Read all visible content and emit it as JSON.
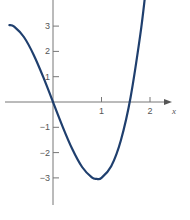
{
  "chart_data": {
    "type": "line",
    "title": "",
    "xlabel": "x",
    "ylabel": "",
    "xlim": [
      -1.1,
      2.7
    ],
    "ylim": [
      -4.7,
      4.0
    ],
    "grid": false,
    "legend": null,
    "x_ticks": [
      {
        "value": 1,
        "label": "1"
      },
      {
        "value": 2,
        "label": "2"
      }
    ],
    "y_ticks": [
      {
        "value": 3,
        "label": "3"
      },
      {
        "value": 2,
        "label": "2"
      },
      {
        "value": 1,
        "label": "1"
      },
      {
        "value": -1,
        "label": "−1"
      },
      {
        "value": -2,
        "label": "−2"
      },
      {
        "value": -3,
        "label": "−3"
      }
    ],
    "series": [
      {
        "name": "f(x)",
        "color": "#1f3f6e",
        "x": [
          -0.9,
          -0.8,
          -0.6,
          -0.4,
          -0.2,
          0.0,
          0.2,
          0.4,
          0.6,
          0.8,
          0.9,
          1.0,
          1.2,
          1.4,
          1.6,
          1.8,
          1.9
        ],
        "y": [
          3.04,
          2.98,
          2.57,
          1.87,
          0.98,
          0.0,
          -0.98,
          -1.87,
          -2.57,
          -2.98,
          -3.04,
          -3.0,
          -2.54,
          -1.51,
          0.19,
          2.66,
          4.2
        ]
      }
    ],
    "annotations": [
      {
        "text": "x",
        "position": "end of x-axis"
      }
    ]
  },
  "colors": {
    "curve": "#1f3f6e",
    "axis": "#777777",
    "text": "#555555"
  }
}
